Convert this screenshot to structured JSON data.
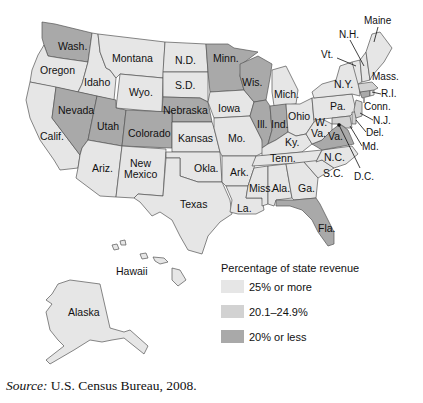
{
  "legend": {
    "title": "Percentage of state revenue",
    "items": [
      {
        "label": "25% or more",
        "color": "#e6e6e6"
      },
      {
        "label": "20.1–24.9%",
        "color": "#d2d2d2"
      },
      {
        "label": "20% or less",
        "color": "#a9a9a9"
      }
    ]
  },
  "colors": {
    "high": "#e6e6e6",
    "mid": "#d2d2d2",
    "low": "#a9a9a9",
    "border": "#555555"
  },
  "source": {
    "prefix": "Source:",
    "text": " U.S. Census Bureau, 2008."
  },
  "states": {
    "wash": "Wash.",
    "oregon": "Oregon",
    "idaho": "Idaho",
    "montana": "Montana",
    "wyo": "Wyo.",
    "nd": "N.D.",
    "sd": "S.D.",
    "nebraska": "Nebraska",
    "calif": "Calif.",
    "nevada": "Nevada",
    "utah": "Utah",
    "colorado": "Colorado",
    "ariz": "Ariz.",
    "newmex1": "New",
    "newmex2": "Mexico",
    "kansas": "Kansas",
    "okla": "Okla.",
    "texas": "Texas",
    "minn": "Minn.",
    "iowa": "Iowa",
    "mo": "Mo.",
    "ark": "Ark.",
    "la": "La.",
    "wis": "Wis.",
    "ill": "Ill.",
    "mich": "Mich.",
    "ind": "Ind.",
    "ohio": "Ohio",
    "ky": "Ky.",
    "tenn": "Tenn.",
    "miss": "Miss.",
    "ala": "Ala.",
    "ga": "Ga.",
    "fla": "Fla.",
    "sc": "S.C.",
    "nc": "N.C.",
    "va": "Va.",
    "wva1": "W.",
    "wva2": "Va.",
    "pa": "Pa.",
    "ny": "N.Y.",
    "vt": "Vt.",
    "nh": "N.H.",
    "maine": "Maine",
    "mass": "Mass.",
    "ri": "R.I.",
    "conn": "Conn.",
    "nj": "N.J.",
    "del": "Del.",
    "md": "Md.",
    "dc": "D.C.",
    "hawaii": "Hawaii",
    "alaska": "Alaska"
  }
}
